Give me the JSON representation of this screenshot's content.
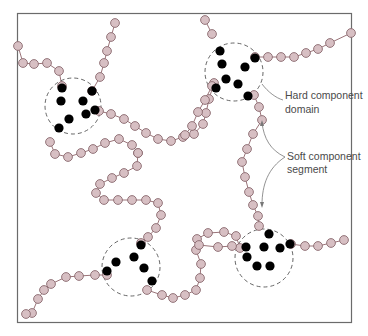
{
  "colors": {
    "frame": "#6b6b6b",
    "soft_bead_fill": "#d7bfc3",
    "soft_bead_stroke": "#8a6a6f",
    "soft_link": "#9a7378",
    "hard_bead": "#000000",
    "domain_circle": "#555555",
    "label_text": "#4a4a4a",
    "leader_line": "#777777"
  },
  "labels": {
    "hard_line1": "Hard component",
    "hard_line2": "domain",
    "soft_line1": "Soft component",
    "soft_line2": "segment"
  },
  "domains": [
    {
      "name": "top-left",
      "cx": 73,
      "cy": 106,
      "r": 28
    },
    {
      "name": "top-right",
      "cx": 234,
      "cy": 72,
      "r": 29
    },
    {
      "name": "bottom-left",
      "cx": 131,
      "cy": 267,
      "r": 29
    },
    {
      "name": "bottom-right",
      "cx": 264,
      "cy": 258,
      "r": 29
    }
  ]
}
